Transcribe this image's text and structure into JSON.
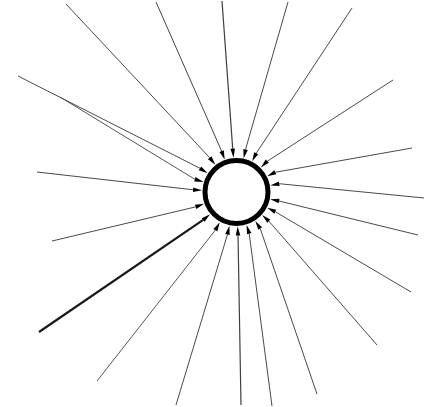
{
  "figure": {
    "background_color": "#ffffff",
    "width": 428,
    "height": 407
  },
  "circle": {
    "name": "central-circle",
    "cx": 236.5,
    "cy": 192,
    "r": 31.5,
    "stroke_color": "#000000",
    "stroke_width": 5.0,
    "fill_color": "#ffffff"
  },
  "rays": {
    "count": 20,
    "default_color": "#4a4a4a",
    "default_width": 1.0,
    "arrowhead_color": "#000000",
    "arrowhead_length": 9,
    "arrowhead_width": 4.6,
    "items": [
      {
        "name": "ray-01",
        "angle_deg": 183,
        "x1": 37,
        "y1": 172,
        "color": "#4a4a4a",
        "width": 1.1
      },
      {
        "name": "ray-02",
        "angle_deg": 197,
        "x1": 60,
        "y1": 97,
        "color": "#555555",
        "width": 1.0
      },
      {
        "name": "ray-03",
        "angle_deg": 213,
        "x1": 18,
        "y1": 76,
        "color": "#4a4a4a",
        "width": 1.0
      },
      {
        "name": "ray-04",
        "angle_deg": 232,
        "x1": 66,
        "y1": 4,
        "color": "#4a4a4a",
        "width": 1.0
      },
      {
        "name": "ray-05",
        "angle_deg": 250,
        "x1": 156,
        "y1": 2,
        "color": "#444444",
        "width": 1.0
      },
      {
        "name": "ray-06",
        "angle_deg": 265,
        "x1": 222,
        "y1": 1,
        "color": "#3f3f3f",
        "width": 1.2
      },
      {
        "name": "ray-07",
        "angle_deg": 282,
        "x1": 288,
        "y1": 2,
        "color": "#4a4a4a",
        "width": 1.0
      },
      {
        "name": "ray-08",
        "angle_deg": 297,
        "x1": 352,
        "y1": 8,
        "color": "#4a4a4a",
        "width": 1.0
      },
      {
        "name": "ray-09",
        "angle_deg": 315,
        "x1": 393,
        "y1": 80,
        "color": "#4a4a4a",
        "width": 1.0
      },
      {
        "name": "ray-10",
        "angle_deg": 333,
        "x1": 412,
        "y1": 148,
        "color": "#4a4a4a",
        "width": 1.0
      },
      {
        "name": "ray-11",
        "angle_deg": 349,
        "x1": 424,
        "y1": 198,
        "color": "#4a4a4a",
        "width": 1.0
      },
      {
        "name": "ray-12",
        "angle_deg": 12,
        "x1": 418,
        "y1": 235,
        "color": "#4a4a4a",
        "width": 1.0
      },
      {
        "name": "ray-13",
        "angle_deg": 27,
        "x1": 411,
        "y1": 292,
        "color": "#4a4a4a",
        "width": 1.0
      },
      {
        "name": "ray-14",
        "angle_deg": 42,
        "x1": 377,
        "y1": 345,
        "color": "#4a4a4a",
        "width": 1.0
      },
      {
        "name": "ray-15",
        "angle_deg": 57,
        "x1": 317,
        "y1": 394,
        "color": "#4a4a4a",
        "width": 1.0
      },
      {
        "name": "ray-16",
        "angle_deg": 73,
        "x1": 272,
        "y1": 406,
        "color": "#4a4a4a",
        "width": 1.0
      },
      {
        "name": "ray-17",
        "angle_deg": 88,
        "x1": 241,
        "y1": 405,
        "color": "#3f3f3f",
        "width": 1.2
      },
      {
        "name": "ray-18",
        "angle_deg": 102,
        "x1": 176,
        "y1": 405,
        "color": "#4a4a4a",
        "width": 1.0
      },
      {
        "name": "ray-19",
        "angle_deg": 119,
        "x1": 97,
        "y1": 381,
        "color": "#555555",
        "width": 1.0
      },
      {
        "name": "ray-20",
        "angle_deg": 140,
        "x1": 39,
        "y1": 332,
        "color": "#1a1a1a",
        "width": 2.2
      },
      {
        "name": "ray-21",
        "angle_deg": 160,
        "x1": 52,
        "y1": 241,
        "color": "#4a4a4a",
        "width": 1.0
      }
    ]
  }
}
